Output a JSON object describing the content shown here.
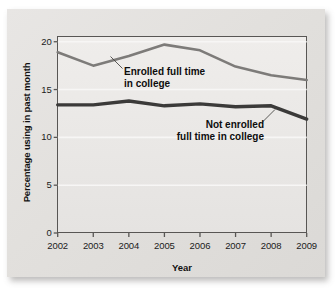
{
  "chart_data": {
    "type": "line",
    "title": "",
    "xlabel": "Year",
    "ylabel": "Percentage using in past month",
    "x": [
      2002,
      2003,
      2004,
      2005,
      2006,
      2007,
      2008,
      2009
    ],
    "xticklabels": [
      "2002",
      "2003",
      "2004",
      "2005",
      "2006",
      "2007",
      "2008",
      "2009"
    ],
    "yticklabels": [
      "0",
      "5",
      "10",
      "15",
      "20"
    ],
    "yticks": [
      0,
      5,
      10,
      15,
      20
    ],
    "ylim": [
      0,
      20.6
    ],
    "xlim": [
      2002,
      2009
    ],
    "grid": "horizontal",
    "legend": "annotations-inline",
    "series": [
      {
        "name": "Enrolled full time in college",
        "values": [
          18.9,
          17.5,
          18.5,
          19.7,
          19.1,
          17.4,
          16.5,
          16.0
        ],
        "color": "#7d7b79",
        "width": 2.6
      },
      {
        "name": "Not enrolled full time in college",
        "values": [
          13.4,
          13.4,
          13.8,
          13.3,
          13.5,
          13.2,
          13.3,
          11.9
        ],
        "color": "#3b3a39",
        "width": 3.4
      }
    ],
    "annotations": [
      {
        "id": "enrolled",
        "text": "Enrolled full time\nin college",
        "target_series": "Enrolled full time in college"
      },
      {
        "id": "not-enrolled",
        "text": "Not enrolled\nfull time in college",
        "target_series": "Not enrolled full time in college"
      }
    ]
  },
  "colors": {
    "card_background": "#e2e0de",
    "plot_background": "#eceae8",
    "axis": "#585654",
    "gridline": "#f7f6f5",
    "text": "#111111",
    "enrolled_line": "#7d7b79",
    "not_enrolled_line": "#3b3a39"
  }
}
